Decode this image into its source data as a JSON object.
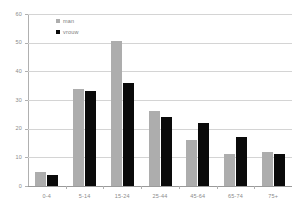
{
  "chart_data": {
    "type": "bar",
    "title": "",
    "subtitle": "",
    "xlabel": "",
    "ylabel": "",
    "categories": [
      "0-4",
      "5-14",
      "15-24",
      "25-44",
      "45-64",
      "65-74",
      "75+"
    ],
    "series": [
      {
        "name": "man",
        "color": "#adadad",
        "values": [
          5,
          34,
          50.5,
          26,
          16,
          11,
          12
        ]
      },
      {
        "name": "vrouw",
        "color": "#0a0a0a",
        "values": [
          4,
          33,
          36,
          24,
          22,
          17,
          11
        ]
      }
    ],
    "ylim": [
      0,
      60
    ],
    "yticks": [
      0,
      10,
      20,
      30,
      40,
      50,
      60
    ],
    "ytick_labels": [
      "0",
      "10",
      "20",
      "30",
      "40",
      "50",
      "60"
    ],
    "grid": true,
    "grid_axis": "y",
    "legend_position": "top-left-inside"
  },
  "legend": {
    "entries": [
      {
        "label": "man"
      },
      {
        "label": "vrouw"
      }
    ]
  },
  "colors": {
    "man": "#adadad",
    "vrouw": "#0a0a0a",
    "grid": "#d4d4d4",
    "axis": "#b0b0b0",
    "text": "#8a8a8a",
    "background": "#ffffff"
  }
}
